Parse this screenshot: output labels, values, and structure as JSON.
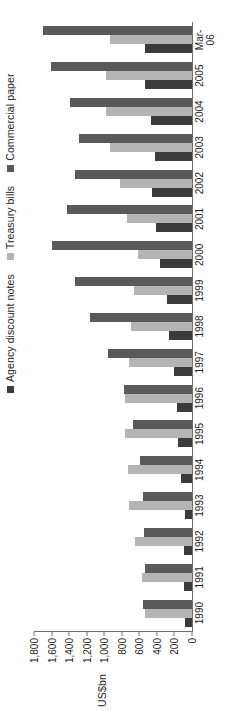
{
  "chart_data": {
    "type": "bar",
    "title": "",
    "subtitle": "",
    "xlabel": "",
    "ylabel": "US$bn",
    "ylim": [
      0,
      1800
    ],
    "yticks": [
      "0",
      "200",
      "400",
      "600",
      "800",
      "1,000",
      "1,200",
      "1,400",
      "1,600",
      "1,800"
    ],
    "ytick_values": [
      0,
      200,
      400,
      600,
      800,
      1000,
      1200,
      1400,
      1600,
      1800
    ],
    "grid": false,
    "legend_position": "top-right",
    "orientation": "vertical-bars-rotated-90ccw",
    "categories": [
      "1990",
      "1991",
      "1992",
      "1993",
      "1994",
      "1995",
      "1996",
      "1997",
      "1998",
      "1999",
      "2000",
      "2001",
      "2002",
      "2003",
      "2004",
      "2005",
      "Mar-\n06"
    ],
    "series": [
      {
        "name": "Agency discount notes",
        "color": "#3b3b3b",
        "values": [
          75,
          95,
          90,
          85,
          120,
          155,
          175,
          205,
          260,
          280,
          360,
          410,
          455,
          420,
          470,
          530,
          540
        ]
      },
      {
        "name": "Treasury bills",
        "color": "#b4b4b4",
        "values": [
          530,
          565,
          650,
          715,
          730,
          760,
          760,
          715,
          690,
          660,
          615,
          735,
          820,
          930,
          980,
          975,
          940
        ]
      },
      {
        "name": "Commercial paper",
        "color": "#595959",
        "values": [
          560,
          535,
          545,
          555,
          595,
          675,
          775,
          960,
          1160,
          1330,
          1590,
          1420,
          1330,
          1290,
          1390,
          1610,
          1700
        ]
      }
    ]
  },
  "legend": {
    "items": [
      {
        "label": "Agency discount notes",
        "color": "#3b3b3b"
      },
      {
        "label": "Treasury bills",
        "color": "#b4b4b4"
      },
      {
        "label": "Commercial paper",
        "color": "#595959"
      }
    ]
  },
  "axis": {
    "y_title": "US$bn"
  }
}
